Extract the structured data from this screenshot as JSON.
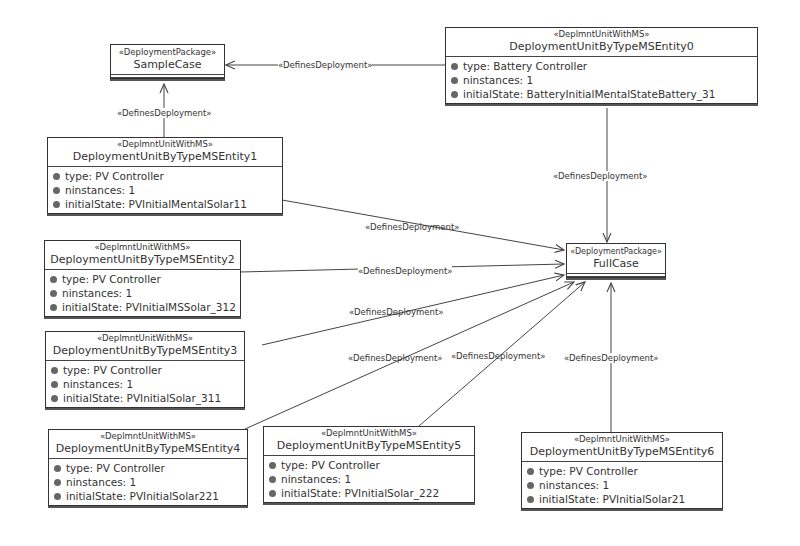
{
  "packages": [
    {
      "id": "sample",
      "stereotype": "«DeploymentPackage»",
      "name": "SampleCase"
    },
    {
      "id": "full",
      "stereotype": "«DeploymentPackage»",
      "name": "FullCase"
    }
  ],
  "units": [
    {
      "stereotype": "«DeplmntUnitWithMS»",
      "name": "DeploymentUnitByTypeMSEntity0",
      "attrs": [
        "type: Battery Controller",
        "ninstances:  1",
        "initialState:  BatteryInitialMentalStateBattery_31"
      ]
    },
    {
      "stereotype": "«DeplmntUnitWithMS»",
      "name": "DeploymentUnitByTypeMSEntity1",
      "attrs": [
        "type: PV Controller",
        "ninstances:  1",
        "initialState:  PVInitialMentalSolar11"
      ]
    },
    {
      "stereotype": "«DeplmntUnitWithMS»",
      "name": "DeploymentUnitByTypeMSEntity2",
      "attrs": [
        "type: PV Controller",
        "ninstances:  1",
        "initialState:  PVInitialMSSolar_312"
      ]
    },
    {
      "stereotype": "«DeplmntUnitWithMS»",
      "name": "DeploymentUnitByTypeMSEntity3",
      "attrs": [
        "type: PV Controller",
        "ninstances:  1",
        "initialState:  PVInitialSolar_311"
      ]
    },
    {
      "stereotype": "«DeplmntUnitWithMS»",
      "name": "DeploymentUnitByTypeMSEntity4",
      "attrs": [
        "type: PV Controller",
        "ninstances:  1",
        "initialState:  PVInitialSolar221"
      ]
    },
    {
      "stereotype": "«DeplmntUnitWithMS»",
      "name": "DeploymentUnitByTypeMSEntity5",
      "attrs": [
        "type: PV Controller",
        "ninstances:  1",
        "initialState:  PVInitialSolar_222"
      ]
    },
    {
      "stereotype": "«DeplmntUnitWithMS»",
      "name": "DeploymentUnitByTypeMSEntity6",
      "attrs": [
        "type: PV Controller",
        "ninstances:  1",
        "initialState:  PVInitialSolar21"
      ]
    }
  ],
  "edges": [
    {
      "label": "«DefinesDeployment»",
      "from": "DeploymentUnitByTypeMSEntity0",
      "to": "SampleCase"
    },
    {
      "label": "«DefinesDeployment»",
      "from": "DeploymentUnitByTypeMSEntity1",
      "to": "SampleCase"
    },
    {
      "label": "«DefinesDeployment»",
      "from": "DeploymentUnitByTypeMSEntity0",
      "to": "FullCase"
    },
    {
      "label": "«DefinesDeployment»",
      "from": "DeploymentUnitByTypeMSEntity1",
      "to": "FullCase"
    },
    {
      "label": "«DefinesDeployment»",
      "from": "DeploymentUnitByTypeMSEntity2",
      "to": "FullCase"
    },
    {
      "label": "«DefinesDeployment»",
      "from": "DeploymentUnitByTypeMSEntity3",
      "to": "FullCase"
    },
    {
      "label": "«DefinesDeployment»",
      "from": "DeploymentUnitByTypeMSEntity4",
      "to": "FullCase"
    },
    {
      "label": "«DefinesDeployment»",
      "from": "DeploymentUnitByTypeMSEntity5",
      "to": "FullCase"
    },
    {
      "label": "«DefinesDeployment»",
      "from": "DeploymentUnitByTypeMSEntity6",
      "to": "FullCase"
    }
  ],
  "colors": {
    "line": "#444444",
    "box_border": "#333333",
    "attr_dot": "#666666"
  }
}
